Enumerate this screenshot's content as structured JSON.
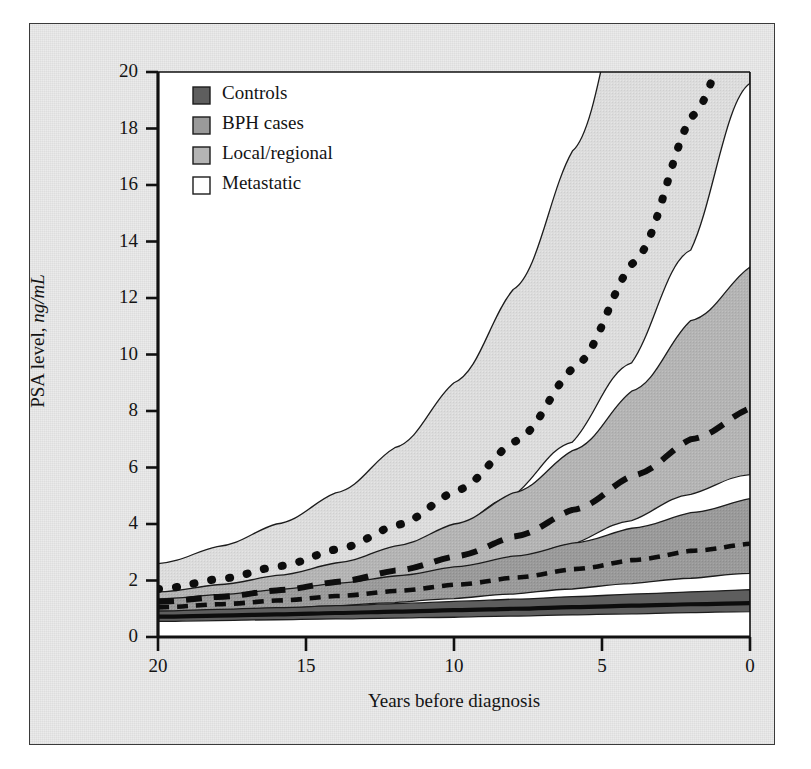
{
  "chart_data": {
    "type": "area",
    "title": "",
    "xlabel": "Years before diagnosis",
    "ylabel_plain": "PSA level, ",
    "ylabel_em": "ng/mL",
    "xlim": [
      20,
      0
    ],
    "ylim": [
      0,
      20
    ],
    "x_reversed": true,
    "grid": false,
    "legend_position": "top-left inside plot",
    "xticks": [
      "20",
      "15",
      "10",
      "5",
      "0"
    ],
    "xtick_values": [
      20,
      15,
      10,
      5,
      0
    ],
    "yticks": [
      "0",
      "2",
      "4",
      "6",
      "8",
      "10",
      "12",
      "14",
      "16",
      "18",
      "20"
    ],
    "ytick_values": [
      0,
      2,
      4,
      6,
      8,
      10,
      12,
      14,
      16,
      18,
      20
    ],
    "x": [
      20,
      18,
      16,
      14,
      12,
      10,
      8,
      6,
      4,
      2,
      0
    ],
    "series": [
      {
        "name": "Controls",
        "line_style": "solid",
        "swatch_color": "#5e5e5e",
        "band_color": "#5e5e5e",
        "values": [
          0.72,
          0.76,
          0.8,
          0.85,
          0.9,
          0.95,
          1.0,
          1.06,
          1.11,
          1.16,
          1.2
        ],
        "band_lower": [
          0.55,
          0.58,
          0.61,
          0.64,
          0.67,
          0.7,
          0.74,
          0.78,
          0.82,
          0.86,
          0.9
        ],
        "band_upper": [
          0.92,
          0.98,
          1.04,
          1.11,
          1.18,
          1.26,
          1.34,
          1.43,
          1.52,
          1.6,
          1.68
        ]
      },
      {
        "name": "BPH cases",
        "line_style": "short-dashed",
        "swatch_color": "#9a9a9a",
        "band_color": "#9a9a9a",
        "values": [
          1.05,
          1.16,
          1.29,
          1.45,
          1.63,
          1.85,
          2.1,
          2.4,
          2.72,
          3.05,
          3.3
        ],
        "band_lower": [
          0.82,
          0.9,
          0.99,
          1.1,
          1.22,
          1.36,
          1.52,
          1.7,
          1.89,
          2.08,
          2.25
        ],
        "band_upper": [
          1.35,
          1.5,
          1.68,
          1.9,
          2.16,
          2.48,
          2.86,
          3.32,
          3.85,
          4.4,
          4.9
        ]
      },
      {
        "name": "Local/regional",
        "line_style": "long-dashed",
        "swatch_color": "#b4b4b4",
        "band_color": "#b4b4b4",
        "values": [
          1.25,
          1.42,
          1.65,
          1.95,
          2.35,
          2.85,
          3.55,
          4.5,
          5.7,
          7.0,
          8.1
        ],
        "band_lower": [
          0.95,
          1.08,
          1.25,
          1.47,
          1.76,
          2.13,
          2.62,
          3.28,
          4.12,
          5.05,
          5.75
        ],
        "band_upper": [
          1.6,
          1.85,
          2.18,
          2.62,
          3.22,
          4.0,
          5.1,
          6.6,
          8.7,
          11.2,
          13.1
        ]
      },
      {
        "name": "Metastatic",
        "line_style": "dotted",
        "swatch_color": "#ffffff",
        "band_color": "#dcdcdc",
        "values": [
          1.7,
          2.05,
          2.5,
          3.1,
          3.95,
          5.15,
          6.9,
          9.5,
          13.2,
          18.4,
          24.0
        ],
        "band_lower": [
          1.2,
          1.45,
          1.78,
          2.22,
          2.85,
          3.72,
          5.0,
          6.9,
          9.7,
          13.7,
          19.6
        ],
        "band_upper": [
          2.6,
          3.2,
          4.0,
          5.1,
          6.7,
          9.0,
          12.3,
          17.2,
          24.5,
          35.0,
          50.0
        ]
      }
    ],
    "annotations": []
  },
  "legend": {
    "items": [
      {
        "label": "Controls"
      },
      {
        "label": "BPH cases"
      },
      {
        "label": "Local/regional"
      },
      {
        "label": "Metastatic"
      }
    ]
  }
}
